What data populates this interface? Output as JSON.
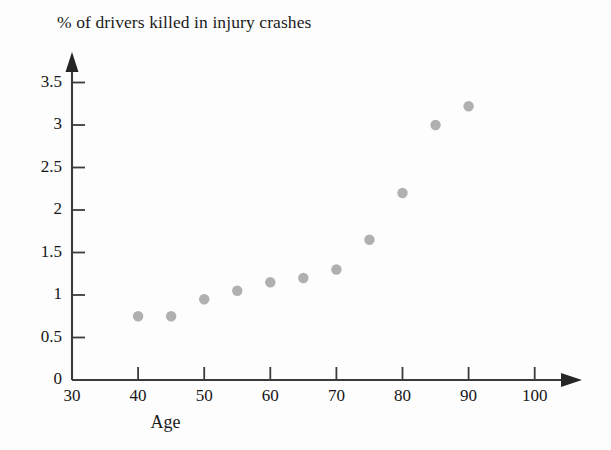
{
  "chart_data": {
    "type": "scatter",
    "title": "% of drivers killed in injury crashes",
    "xlabel": "Age",
    "ylabel": "",
    "x": [
      40,
      45,
      50,
      55,
      60,
      65,
      70,
      75,
      80,
      85,
      90
    ],
    "values": [
      0.75,
      0.75,
      0.95,
      1.05,
      1.15,
      1.2,
      1.3,
      1.65,
      2.2,
      3.0,
      3.22
    ],
    "series": [
      {
        "name": "% of drivers killed in injury crashes",
        "points": [
          {
            "x": 40,
            "y": 0.75
          },
          {
            "x": 45,
            "y": 0.75
          },
          {
            "x": 50,
            "y": 0.95
          },
          {
            "x": 55,
            "y": 1.05
          },
          {
            "x": 60,
            "y": 1.15
          },
          {
            "x": 65,
            "y": 1.2
          },
          {
            "x": 70,
            "y": 1.3
          },
          {
            "x": 75,
            "y": 1.65
          },
          {
            "x": 80,
            "y": 2.2
          },
          {
            "x": 85,
            "y": 3.0
          },
          {
            "x": 90,
            "y": 3.22
          }
        ]
      }
    ],
    "xlim": [
      30,
      103
    ],
    "ylim": [
      0,
      3.75
    ],
    "xticks": [
      30,
      40,
      50,
      60,
      70,
      80,
      90,
      100
    ],
    "xtick_labels": [
      "30",
      "40",
      "50",
      "60",
      "70",
      "80",
      "90",
      "100"
    ],
    "yticks": [
      0,
      0.5,
      1,
      1.5,
      2,
      2.5,
      3,
      3.5
    ],
    "ytick_labels": [
      "0",
      "0.5",
      "1",
      "1.5",
      "2",
      "2.5",
      "3",
      "3.5"
    ],
    "grid": false,
    "legend": false,
    "marker_color": "#b0b0b0",
    "axis_color": "#3b3b3b"
  }
}
